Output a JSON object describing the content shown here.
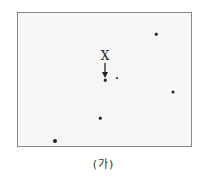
{
  "figure": {
    "frame": {
      "left": 17,
      "top": 12,
      "width": 175,
      "height": 135,
      "background": "#f6f6f6",
      "border": "#8a8a8a"
    },
    "target_label": {
      "text": "X",
      "x": 105,
      "y": 56
    },
    "arrow": {
      "x": 105,
      "y_start": 63,
      "y_end": 77,
      "color": "#222222"
    },
    "stars": [
      {
        "x": 156,
        "y": 34,
        "size": 2.5
      },
      {
        "x": 105,
        "y": 80,
        "size": 2.5
      },
      {
        "x": 117,
        "y": 78,
        "size": 2
      },
      {
        "x": 173,
        "y": 92,
        "size": 3
      },
      {
        "x": 100,
        "y": 118,
        "size": 2.5
      },
      {
        "x": 55,
        "y": 141,
        "size": 4
      }
    ],
    "caption": "(가)"
  }
}
